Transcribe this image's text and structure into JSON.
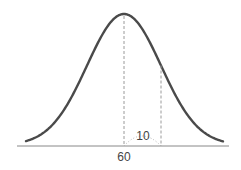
{
  "diagram": {
    "type": "normal-distribution-curve",
    "mean_label": "60",
    "std_dev_label": "10",
    "colors": {
      "curve": "#4a4a4a",
      "axis": "#888888",
      "guides": "#9a9a9a",
      "text": "#444444"
    }
  }
}
